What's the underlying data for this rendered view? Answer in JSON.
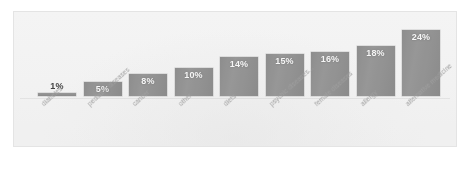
{
  "chart_data": {
    "type": "bar",
    "title": "",
    "subtitle": "",
    "xlabel": "",
    "ylabel": "",
    "ylim": [
      0,
      26
    ],
    "grid": false,
    "legend": null,
    "value_suffix": "%",
    "categories": [
      "diabetes",
      "pediatric diseases",
      "cancer",
      "other",
      "diets",
      "psychic diseases...",
      "female diseases",
      "allergy",
      "alternative medicine"
    ],
    "values": [
      1,
      5,
      8,
      10,
      14,
      15,
      16,
      18,
      24
    ],
    "data_labels": [
      "1%",
      "5%",
      "8%",
      "10%",
      "14%",
      "15%",
      "16%",
      "18%",
      "24%"
    ],
    "series": [
      {
        "name": "share",
        "values": [
          1,
          5,
          8,
          10,
          14,
          15,
          16,
          18,
          24
        ]
      }
    ]
  },
  "style": {
    "bar_color": "#8f8f8f",
    "label_color": "#ffffff",
    "category_color": "#a2a2a2",
    "background": "#fbfbfb",
    "frame_border": "#ececec"
  }
}
